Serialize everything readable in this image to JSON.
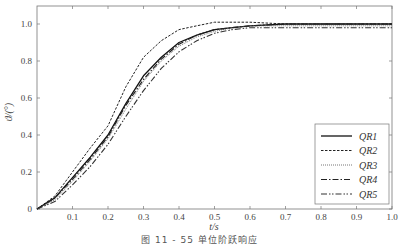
{
  "caption": "图 11 - 55   单位阶跃响应",
  "chart_data": {
    "type": "line",
    "title": "",
    "caption": "图 11-55 单位阶跃响应",
    "xlabel": "t/s",
    "ylabel": "ϑ/(°)",
    "xlim": [
      0,
      1.0
    ],
    "ylim": [
      0,
      1.1
    ],
    "grid": false,
    "legend_position": "lower right",
    "x_ticks": [
      0.1,
      0.2,
      0.3,
      0.4,
      0.5,
      0.6,
      0.7,
      0.8,
      0.9,
      1.0
    ],
    "x_tick_labels": [
      "0.1",
      "0.2",
      "0.3",
      "0.4",
      "0.5",
      "0.6",
      "0.7",
      "0.8",
      "0.9",
      "1.0"
    ],
    "y_ticks": [
      0,
      0.2,
      0.4,
      0.6,
      0.8,
      1.0
    ],
    "y_tick_labels": [
      "0",
      "0.2",
      "0.4",
      "0.6",
      "0.8",
      "1.0"
    ],
    "x": [
      0,
      0.05,
      0.1,
      0.15,
      0.2,
      0.25,
      0.3,
      0.35,
      0.4,
      0.45,
      0.5,
      0.55,
      0.6,
      0.7,
      0.8,
      0.9,
      1.0
    ],
    "series": [
      {
        "name": "QR1",
        "style": "solid",
        "values": [
          0,
          0.06,
          0.17,
          0.28,
          0.4,
          0.57,
          0.72,
          0.82,
          0.9,
          0.94,
          0.97,
          0.98,
          0.99,
          1.0,
          1.0,
          1.0,
          1.0
        ]
      },
      {
        "name": "QR2",
        "style": "dashed",
        "values": [
          0,
          0.07,
          0.2,
          0.33,
          0.45,
          0.66,
          0.82,
          0.91,
          0.97,
          0.99,
          1.01,
          1.01,
          1.01,
          1.0,
          1.0,
          1.0,
          1.0
        ]
      },
      {
        "name": "QR3",
        "style": "dotted",
        "values": [
          0,
          0.05,
          0.15,
          0.26,
          0.38,
          0.54,
          0.69,
          0.8,
          0.88,
          0.93,
          0.96,
          0.98,
          0.99,
          0.99,
          0.99,
          0.99,
          0.99
        ]
      },
      {
        "name": "QR4",
        "style": "dash-dot",
        "values": [
          0,
          0.06,
          0.16,
          0.27,
          0.39,
          0.56,
          0.7,
          0.81,
          0.89,
          0.94,
          0.97,
          0.98,
          0.99,
          1.0,
          1.0,
          1.0,
          1.0
        ]
      },
      {
        "name": "QR5",
        "style": "dash-dot-dot",
        "values": [
          0,
          0.04,
          0.13,
          0.23,
          0.35,
          0.5,
          0.64,
          0.76,
          0.85,
          0.91,
          0.95,
          0.97,
          0.98,
          0.98,
          0.98,
          0.98,
          0.98
        ]
      }
    ]
  }
}
